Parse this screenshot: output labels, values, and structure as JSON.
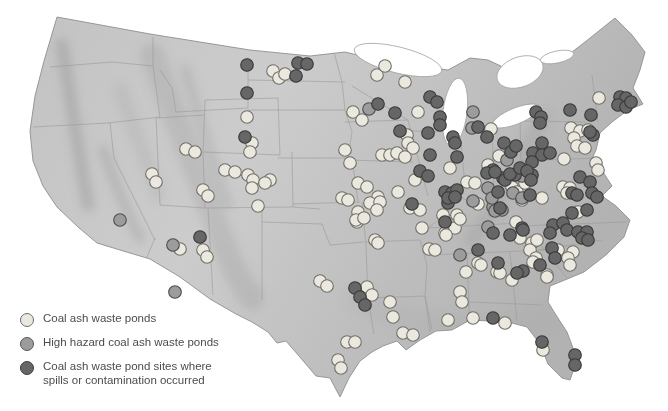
{
  "figure": {
    "width": 668,
    "height": 411,
    "background": "#ffffff"
  },
  "legend": {
    "items": [
      {
        "id": "pond",
        "label": "Coal ash waste ponds",
        "fill": "#ebe8df",
        "stroke": "#6f6e67"
      },
      {
        "id": "hazard",
        "label": "High hazard coal ash waste ponds",
        "fill": "#9c9c9c",
        "stroke": "#565656"
      },
      {
        "id": "spill",
        "label": "Coal ash waste pond sites where spills or contamination occurred",
        "label_line1": "Coal ash waste pond sites where",
        "label_line2": "spills or contamination occurred",
        "fill": "#666666",
        "stroke": "#3d3d3d"
      }
    ]
  },
  "map": {
    "name": "us-coal-ash-waste-pond-map",
    "dot_radius": 6.3,
    "dot_styles": {
      "pond": {
        "fill": "#ebe8df",
        "stroke": "#6f6e67"
      },
      "hazard": {
        "fill": "#9c9c9c",
        "stroke": "#4d4d4d"
      },
      "spill": {
        "fill": "#666666",
        "stroke": "#383838"
      }
    },
    "dots": {
      "pond": [
        [
          273,
          71
        ],
        [
          279,
          78
        ],
        [
          285,
          74
        ],
        [
          247,
          117
        ],
        [
          252,
          143
        ],
        [
          250,
          152
        ],
        [
          186,
          149
        ],
        [
          195,
          152
        ],
        [
          152,
          174
        ],
        [
          156,
          182
        ],
        [
          225,
          170
        ],
        [
          235,
          172
        ],
        [
          248,
          175
        ],
        [
          253,
          180
        ],
        [
          252,
          188
        ],
        [
          270,
          180
        ],
        [
          265,
          183
        ],
        [
          258,
          206
        ],
        [
          203,
          190
        ],
        [
          208,
          196
        ],
        [
          180,
          249
        ],
        [
          203,
          250
        ],
        [
          207,
          257
        ],
        [
          320,
          281
        ],
        [
          327,
          286
        ],
        [
          345,
          150
        ],
        [
          350,
          163
        ],
        [
          358,
          183
        ],
        [
          367,
          187
        ],
        [
          342,
          198
        ],
        [
          348,
          200
        ],
        [
          378,
          197
        ],
        [
          370,
          203
        ],
        [
          380,
          202
        ],
        [
          358,
          212
        ],
        [
          357,
          222
        ],
        [
          375,
          240
        ],
        [
          398,
          192
        ],
        [
          377,
          75
        ],
        [
          385,
          66
        ],
        [
          405,
          82
        ],
        [
          353,
          112
        ],
        [
          362,
          120
        ],
        [
          418,
          112
        ],
        [
          407,
          135
        ],
        [
          408,
          143
        ],
        [
          413,
          148
        ],
        [
          382,
          155
        ],
        [
          390,
          155
        ],
        [
          397,
          153
        ],
        [
          405,
          157
        ],
        [
          491,
          129
        ],
        [
          450,
          168
        ],
        [
          467,
          182
        ],
        [
          475,
          183
        ],
        [
          488,
          165
        ],
        [
          415,
          180
        ],
        [
          499,
          156
        ],
        [
          410,
          208
        ],
        [
          420,
          210
        ],
        [
          422,
          228
        ],
        [
          445,
          233
        ],
        [
          455,
          228
        ],
        [
          429,
          249
        ],
        [
          435,
          250
        ],
        [
          356,
          220
        ],
        [
          364,
          218
        ],
        [
          377,
          210
        ],
        [
          378,
          243
        ],
        [
          443,
          215
        ],
        [
          457,
          215
        ],
        [
          460,
          219
        ],
        [
          516,
          222
        ],
        [
          520,
          238
        ],
        [
          478,
          204
        ],
        [
          478,
          263
        ],
        [
          466,
          272
        ],
        [
          497,
          272
        ],
        [
          532,
          243
        ],
        [
          530,
          250
        ],
        [
          536,
          258
        ],
        [
          533,
          262
        ],
        [
          446,
          235
        ],
        [
          460,
          292
        ],
        [
          462,
          302
        ],
        [
          448,
          320
        ],
        [
          473,
          318
        ],
        [
          481,
          265
        ],
        [
          547,
          275
        ],
        [
          500,
          273
        ],
        [
          543,
          350
        ],
        [
          505,
          323
        ],
        [
          367,
          287
        ],
        [
          372,
          295
        ],
        [
          390,
          302
        ],
        [
          393,
          317
        ],
        [
          403,
          333
        ],
        [
          413,
          335
        ],
        [
          347,
          342
        ],
        [
          355,
          342
        ],
        [
          338,
          360
        ],
        [
          341,
          368
        ],
        [
          599,
          98
        ],
        [
          571,
          128
        ],
        [
          580,
          131
        ],
        [
          574,
          138
        ],
        [
          577,
          146
        ],
        [
          585,
          148
        ],
        [
          588,
          130
        ],
        [
          564,
          159
        ],
        [
          596,
          163
        ],
        [
          598,
          170
        ],
        [
          563,
          187
        ],
        [
          570,
          188
        ],
        [
          567,
          193
        ],
        [
          542,
          198
        ],
        [
          512,
          187
        ],
        [
          517,
          192
        ],
        [
          525,
          183
        ],
        [
          522,
          200
        ],
        [
          578,
          212
        ],
        [
          537,
          240
        ],
        [
          558,
          250
        ],
        [
          573,
          252
        ],
        [
          568,
          258
        ],
        [
          570,
          265
        ],
        [
          547,
          277
        ],
        [
          512,
          280
        ]
      ],
      "hazard": [
        [
          120,
          220
        ],
        [
          173,
          245
        ],
        [
          175,
          292
        ],
        [
          369,
          109
        ],
        [
          473,
          112
        ],
        [
          472,
          128
        ],
        [
          488,
          188
        ],
        [
          493,
          207
        ],
        [
          502,
          210
        ],
        [
          473,
          201
        ],
        [
          513,
          193
        ],
        [
          522,
          198
        ],
        [
          507,
          160
        ],
        [
          522,
          176
        ],
        [
          492,
          198
        ],
        [
          495,
          211
        ],
        [
          488,
          227
        ],
        [
          460,
          255
        ]
      ],
      "spill": [
        [
          247,
          65
        ],
        [
          298,
          63
        ],
        [
          307,
          64
        ],
        [
          296,
          76
        ],
        [
          247,
          93
        ],
        [
          245,
          137
        ],
        [
          200,
          237
        ],
        [
          430,
          97
        ],
        [
          437,
          102
        ],
        [
          378,
          104
        ],
        [
          395,
          113
        ],
        [
          440,
          117
        ],
        [
          440,
          125
        ],
        [
          428,
          133
        ],
        [
          453,
          137
        ],
        [
          455,
          143
        ],
        [
          478,
          127
        ],
        [
          400,
          131
        ],
        [
          430,
          155
        ],
        [
          457,
          157
        ],
        [
          487,
          137
        ],
        [
          420,
          171
        ],
        [
          428,
          176
        ],
        [
          493,
          170
        ],
        [
          503,
          178
        ],
        [
          515,
          175
        ],
        [
          445,
          192
        ],
        [
          452,
          193
        ],
        [
          457,
          190
        ],
        [
          448,
          203
        ],
        [
          412,
          204
        ],
        [
          498,
          192
        ],
        [
          445,
          222
        ],
        [
          500,
          208
        ],
        [
          448,
          198
        ],
        [
          455,
          197
        ],
        [
          493,
          233
        ],
        [
          510,
          235
        ],
        [
          522,
          228
        ],
        [
          478,
          250
        ],
        [
          498,
          263
        ],
        [
          523,
          271
        ],
        [
          552,
          248
        ],
        [
          620,
          97
        ],
        [
          626,
          98
        ],
        [
          618,
          105
        ],
        [
          626,
          107
        ],
        [
          631,
          102
        ],
        [
          570,
          110
        ],
        [
          591,
          115
        ],
        [
          593,
          135
        ],
        [
          590,
          132
        ],
        [
          536,
          112
        ],
        [
          541,
          117
        ],
        [
          540,
          123
        ],
        [
          542,
          143
        ],
        [
          533,
          153
        ],
        [
          542,
          155
        ],
        [
          550,
          153
        ],
        [
          532,
          162
        ],
        [
          487,
          173
        ],
        [
          495,
          172
        ],
        [
          505,
          180
        ],
        [
          510,
          174
        ],
        [
          532,
          175
        ],
        [
          520,
          168
        ],
        [
          527,
          171
        ],
        [
          531,
          180
        ],
        [
          504,
          143
        ],
        [
          511,
          152
        ],
        [
          516,
          146
        ],
        [
          580,
          177
        ],
        [
          590,
          182
        ],
        [
          530,
          195
        ],
        [
          572,
          193
        ],
        [
          577,
          195
        ],
        [
          592,
          193
        ],
        [
          597,
          197
        ],
        [
          572,
          213
        ],
        [
          587,
          210
        ],
        [
          523,
          230
        ],
        [
          553,
          225
        ],
        [
          563,
          223
        ],
        [
          567,
          230
        ],
        [
          578,
          232
        ],
        [
          587,
          232
        ],
        [
          550,
          233
        ],
        [
          582,
          238
        ],
        [
          588,
          240
        ],
        [
          555,
          258
        ],
        [
          540,
          265
        ],
        [
          517,
          273
        ],
        [
          355,
          288
        ],
        [
          360,
          297
        ],
        [
          365,
          305
        ],
        [
          493,
          318
        ],
        [
          542,
          342
        ],
        [
          575,
          355
        ],
        [
          575,
          365
        ]
      ]
    }
  }
}
